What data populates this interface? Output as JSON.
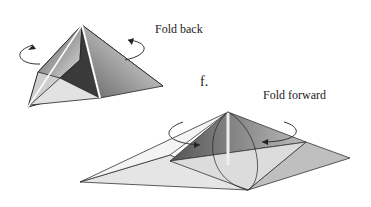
{
  "diagram": {
    "step_label": "f.",
    "top_figure": {
      "instruction": "Fold back"
    },
    "bottom_figure": {
      "instruction": "Fold forward"
    }
  }
}
